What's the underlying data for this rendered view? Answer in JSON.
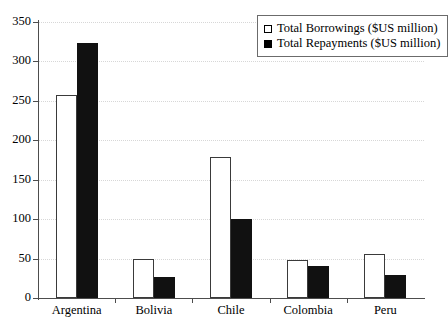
{
  "chart_data": {
    "type": "bar",
    "title": "",
    "xlabel": "",
    "ylabel": "",
    "categories": [
      "Argentina",
      "Bolivia",
      "Chile",
      "Colombia",
      "Peru"
    ],
    "series": [
      {
        "name": "Total Borrowings ($US million)",
        "color": "#ffffff",
        "values": [
          258,
          50,
          179,
          48,
          56
        ]
      },
      {
        "name": "Total Repayments ($US million)",
        "color": "#000000",
        "values": [
          323,
          26,
          100,
          41,
          29
        ]
      }
    ],
    "ylim": [
      0,
      350
    ],
    "yticks": [
      0,
      50,
      100,
      150,
      200,
      250,
      300,
      350
    ],
    "ytick_labels": [
      "0",
      "50",
      "100",
      "150",
      "200",
      "250",
      "300",
      "350"
    ],
    "grid": true,
    "grid_axis": "y",
    "legend_position": "top-right"
  },
  "legend": {
    "items": [
      {
        "label": "Total Borrowings ($US million)",
        "swatch": "open-square-swatch"
      },
      {
        "label": "Total Repayments ($US million)",
        "swatch": "filled-square-swatch"
      }
    ]
  }
}
